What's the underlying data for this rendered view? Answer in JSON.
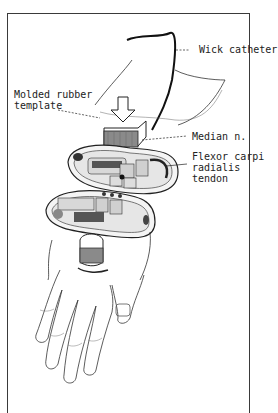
{
  "figure": {
    "type": "anatomical-illustration",
    "labels": {
      "wick_catheter": "Wick catheter",
      "template": "Molded rubber\ntemplate",
      "median_nerve": "Median n.",
      "fcr_tendon": "Flexor carpi\nradialis\ntendon"
    },
    "colors": {
      "frame": "#3a3a3a",
      "ink": "#222222",
      "background": "#ffffff"
    }
  }
}
